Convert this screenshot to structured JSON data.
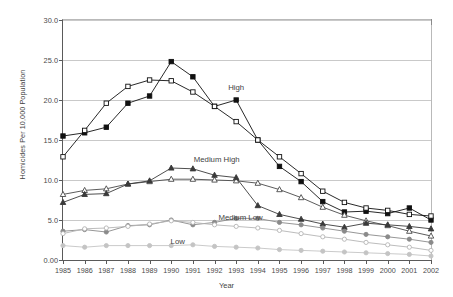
{
  "chart_data": {
    "type": "line",
    "title": "",
    "xlabel": "Year",
    "ylabel": "Homicides Per 10,000 Population",
    "xlim": [
      1985,
      2002
    ],
    "ylim": [
      0,
      30
    ],
    "ytick_labels": [
      "0.00",
      "5.0",
      "10.0",
      "15.0",
      "20.0",
      "25.0",
      "30.0"
    ],
    "ytick_values": [
      0,
      5,
      10,
      15,
      20,
      25,
      30
    ],
    "grid": "horizontal",
    "legend": "inline-annotations",
    "categories": [
      1985,
      1986,
      1987,
      1988,
      1989,
      1990,
      1991,
      1992,
      1993,
      1994,
      1995,
      1996,
      1997,
      1998,
      1999,
      2000,
      2001,
      2002
    ],
    "x": [
      "1985",
      "1986",
      "1987",
      "1988",
      "1989",
      "1990",
      "1991",
      "1992",
      "1993",
      "1994",
      "1995",
      "1996",
      "1997",
      "1998",
      "1999",
      "2000",
      "2001",
      "2002"
    ],
    "annotations": [
      {
        "text": "High",
        "x": 1993.0,
        "y": 21.6
      },
      {
        "text": "Medium High",
        "x": 1992.1,
        "y": 12.6
      },
      {
        "text": "Medium Low",
        "x": 1993.2,
        "y": 5.4
      },
      {
        "text": "Low",
        "x": 1990.3,
        "y": 2.4
      }
    ],
    "series": [
      {
        "name": "High - filled square",
        "group": "High",
        "marker": "filled-square",
        "color": "#111111",
        "values": [
          15.5,
          15.9,
          16.6,
          19.6,
          20.5,
          24.8,
          22.9,
          19.2,
          20.0,
          15.0,
          11.7,
          9.8,
          7.3,
          6.0,
          6.1,
          5.8,
          6.5,
          5.0
        ]
      },
      {
        "name": "High - open square",
        "group": "High",
        "marker": "open-square",
        "color": "#111111",
        "values": [
          12.9,
          16.2,
          19.6,
          21.7,
          22.5,
          22.4,
          21.0,
          19.2,
          17.3,
          15.0,
          12.9,
          10.8,
          8.6,
          7.2,
          6.5,
          6.2,
          5.7,
          5.5
        ]
      },
      {
        "name": "Medium High - open triangle",
        "group": "Medium High",
        "marker": "open-triangle",
        "color": "#4a4a4a",
        "values": [
          8.2,
          8.7,
          8.9,
          9.5,
          9.8,
          10.1,
          10.1,
          10.0,
          9.9,
          9.6,
          8.8,
          7.8,
          6.6,
          5.6,
          4.9,
          4.3,
          3.6,
          3.0
        ]
      },
      {
        "name": "Medium High - filled triangle",
        "group": "Medium High",
        "marker": "filled-triangle",
        "color": "#3a3a3a",
        "values": [
          7.2,
          8.2,
          8.3,
          9.5,
          9.9,
          11.5,
          11.4,
          10.6,
          10.3,
          6.8,
          5.7,
          5.1,
          4.5,
          4.1,
          4.6,
          4.4,
          4.2,
          3.9
        ]
      },
      {
        "name": "Medium Low - filled circle",
        "group": "Medium Low",
        "marker": "filled-circle",
        "color": "#8a8a8a",
        "values": [
          3.6,
          3.8,
          3.5,
          4.3,
          4.4,
          5.0,
          4.4,
          4.7,
          5.2,
          5.2,
          4.7,
          4.4,
          4.0,
          3.6,
          3.2,
          2.9,
          2.6,
          2.2
        ]
      },
      {
        "name": "Medium Low - open circle",
        "group": "Medium Low",
        "marker": "open-circle",
        "color": "#b4b4b4",
        "values": [
          3.3,
          3.9,
          4.0,
          4.2,
          4.5,
          4.9,
          4.7,
          4.4,
          4.2,
          4.0,
          3.7,
          3.3,
          2.9,
          2.6,
          2.2,
          1.9,
          1.6,
          1.2
        ]
      },
      {
        "name": "Low - filled circle",
        "group": "Low",
        "marker": "filled-circle",
        "color": "#c4c4c4",
        "values": [
          1.8,
          1.6,
          1.8,
          1.8,
          1.8,
          1.8,
          1.9,
          1.7,
          1.6,
          1.5,
          1.3,
          1.2,
          1.1,
          1.0,
          0.9,
          0.8,
          0.7,
          0.5
        ]
      }
    ]
  }
}
